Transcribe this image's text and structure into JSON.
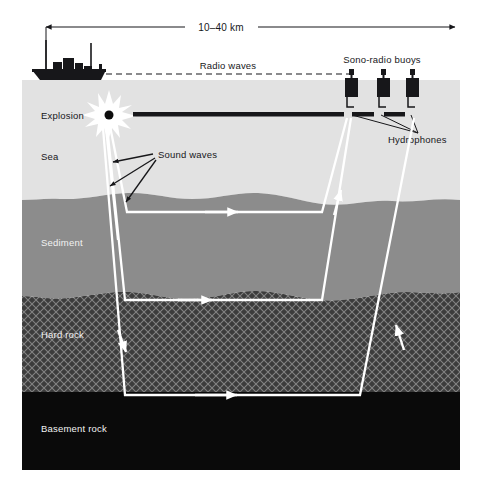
{
  "figure": {
    "background_color": "#ffffff"
  },
  "scale_bar": {
    "label": "10–40 km",
    "arrow_style": "double-headed"
  },
  "annotations": {
    "radio_waves": "Radio waves",
    "sono_radio_buoys": "Sono-radio buoys",
    "hydrophones": "Hydrophones",
    "explosion": "Explosion",
    "sound_waves": "Sound waves"
  },
  "layers": [
    {
      "id": "sea",
      "label": "Sea",
      "label_color": "#17171a",
      "fill": "#e2e2e2",
      "top": 80,
      "bottom": 200
    },
    {
      "id": "sediment",
      "label": "Sediment",
      "label_color": "#f2f2f2",
      "fill": "#8c8c8c",
      "top": 200,
      "bottom": 296
    },
    {
      "id": "hard-rock",
      "label": "Hard rock",
      "label_color": "#f2f2f2",
      "fill": "#3c3c3c",
      "top": 296,
      "bottom": 392
    },
    {
      "id": "basement-rock",
      "label": "Basement rock",
      "label_color": "#f2f2f2",
      "fill": "#0a0a0a",
      "top": 392,
      "bottom": 470
    }
  ],
  "objects": {
    "ship": {
      "name": "survey-ship",
      "color": "#17171a",
      "masts": 2
    },
    "buoys": {
      "count": 3,
      "color": "#17171a"
    },
    "streamer_cable": {
      "color": "#17171a"
    }
  },
  "colors": {
    "ray": "#ffffff",
    "ink": "#17171a",
    "sea": "#e2e2e2",
    "sediment": "#8c8c8c",
    "hard_rock": "#3c3c3c",
    "basement_rock": "#0a0a0a"
  }
}
